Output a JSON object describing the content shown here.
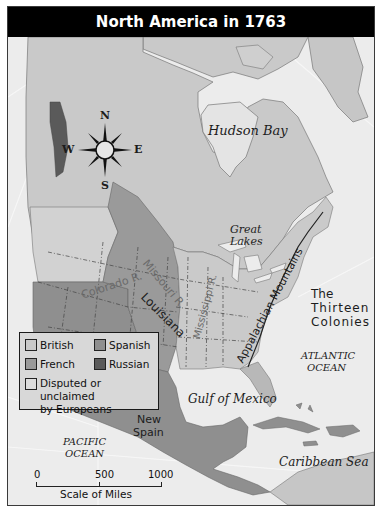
{
  "map": {
    "title": "North America in 1763",
    "labels": {
      "hudson_bay": "Hudson Bay",
      "great_lakes_line1": "Great",
      "great_lakes_line2": "Lakes",
      "colorado_river": "Colorado R.",
      "missouri_river": "Missouri R.",
      "mississippi_river": "Mississippi R.",
      "louisiana": "Louisiana",
      "appalachian": "Appalachian Mountains",
      "thirteen_line1": "The",
      "thirteen_line2": "Thirteen",
      "thirteen_line3": "Colonies",
      "atlantic_line1": "ATLANTIC",
      "atlantic_line2": "OCEAN",
      "gulf": "Gulf of Mexico",
      "new_spain_line1": "New",
      "new_spain_line2": "Spain",
      "pacific_line1": "PACIFIC",
      "pacific_line2": "OCEAN",
      "caribbean": "Caribbean Sea"
    },
    "compass": {
      "n": "N",
      "s": "S",
      "e": "E",
      "w": "W"
    },
    "legend": {
      "items": [
        {
          "label": "British",
          "color": "#c9c9c9"
        },
        {
          "label": "Spanish",
          "color": "#8f8f8f"
        },
        {
          "label": "French",
          "color": "#9a9a9a"
        },
        {
          "label": "Russian",
          "color": "#5a5a5a"
        },
        {
          "label": "Disputed or unclaimed",
          "label2": "by Europeans",
          "color": "#dcdcdc"
        }
      ]
    },
    "scale": {
      "ticks": [
        "0",
        "500",
        "1000"
      ],
      "label": "Scale of Miles"
    },
    "colors": {
      "british": "#c9c9c9",
      "spanish": "#8f8f8f",
      "french": "#9a9a9a",
      "russian": "#5a5a5a",
      "unclaimed": "#dcdcdc",
      "water": "#ececec",
      "title_bg": "#000000"
    }
  }
}
